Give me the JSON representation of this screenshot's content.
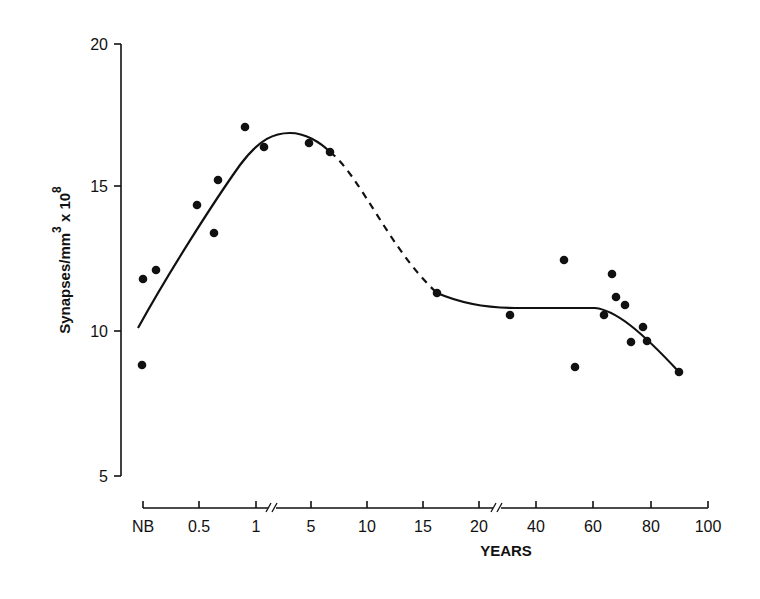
{
  "chart_data": {
    "type": "scatter",
    "title": "",
    "xlabel": "YEARS",
    "ylabel": "Synapses/mm³ x 10⁸",
    "ylabel_parts": {
      "main": "Synapses/mm",
      "sup1": "3",
      "mid": " x 10",
      "sup2": "8"
    },
    "ylim": [
      5,
      20
    ],
    "yticks": [
      5,
      10,
      15,
      20
    ],
    "x_categories": [
      "NB",
      "0.5",
      "1",
      "5",
      "10",
      "15",
      "20",
      "40",
      "60",
      "80",
      "100"
    ],
    "x_axis_breaks": [
      "between 1 and 5",
      "between 20 and 40"
    ],
    "grid": false,
    "legend": null,
    "series": [
      {
        "name": "observations",
        "kind": "points",
        "points": [
          {
            "x": "NB",
            "y": 8.8
          },
          {
            "x": "NB",
            "y": 11.8
          },
          {
            "x": 0.1,
            "y": 12.1
          },
          {
            "x": 0.5,
            "y": 14.4
          },
          {
            "x": 0.6,
            "y": 13.4
          },
          {
            "x": 0.65,
            "y": 15.3
          },
          {
            "x": 0.9,
            "y": 17.1
          },
          {
            "x": 1.1,
            "y": 16.4
          },
          {
            "x": 5,
            "y": 16.5
          },
          {
            "x": 7,
            "y": 16.2
          },
          {
            "x": 16,
            "y": 11.3
          },
          {
            "x": 30,
            "y": 10.6
          },
          {
            "x": 50,
            "y": 12.5
          },
          {
            "x": 54,
            "y": 8.7
          },
          {
            "x": 64,
            "y": 10.6
          },
          {
            "x": 66,
            "y": 12.0
          },
          {
            "x": 68,
            "y": 11.2
          },
          {
            "x": 71,
            "y": 10.9
          },
          {
            "x": 73,
            "y": 9.6
          },
          {
            "x": 77,
            "y": 10.1
          },
          {
            "x": 78,
            "y": 9.7
          },
          {
            "x": 90,
            "y": 8.6
          }
        ]
      },
      {
        "name": "fitted curve",
        "kind": "line",
        "segments": [
          {
            "style": "solid",
            "from": "NB",
            "to": 7,
            "values": [
              {
                "x": "NB",
                "y": 10.1
              },
              {
                "x": 1,
                "y": 16.6
              },
              {
                "x": 3,
                "y": 16.8
              },
              {
                "x": 7,
                "y": 16.2
              }
            ]
          },
          {
            "style": "dashed",
            "from": 7,
            "to": 16,
            "values": [
              {
                "x": 7,
                "y": 16.2
              },
              {
                "x": 10,
                "y": 14.5
              },
              {
                "x": 16,
                "y": 11.3
              }
            ]
          },
          {
            "style": "solid",
            "from": 16,
            "to": 90,
            "values": [
              {
                "x": 16,
                "y": 11.3
              },
              {
                "x": 30,
                "y": 10.8
              },
              {
                "x": 60,
                "y": 10.8
              },
              {
                "x": 90,
                "y": 8.6
              }
            ]
          }
        ]
      }
    ]
  },
  "pixel_layout": {
    "y_axis_x": 121,
    "y_ticks_px": [
      476,
      331,
      186,
      44
    ],
    "x_axis_y": 508,
    "x_ticks_px": [
      143,
      199,
      256,
      311,
      367,
      423,
      479,
      536,
      593,
      651,
      708
    ],
    "points_px": [
      [
        142,
        365
      ],
      [
        143,
        279
      ],
      [
        156,
        270
      ],
      [
        197,
        205
      ],
      [
        214,
        233
      ],
      [
        218,
        180
      ],
      [
        245,
        127
      ],
      [
        264,
        147
      ],
      [
        309,
        143
      ],
      [
        330,
        152
      ],
      [
        437,
        293
      ],
      [
        510,
        315
      ],
      [
        564,
        260
      ],
      [
        575,
        367
      ],
      [
        604,
        315
      ],
      [
        612,
        274
      ],
      [
        616,
        297
      ],
      [
        625,
        305
      ],
      [
        631,
        342
      ],
      [
        643,
        327
      ],
      [
        647,
        341
      ],
      [
        679,
        372
      ]
    ]
  }
}
